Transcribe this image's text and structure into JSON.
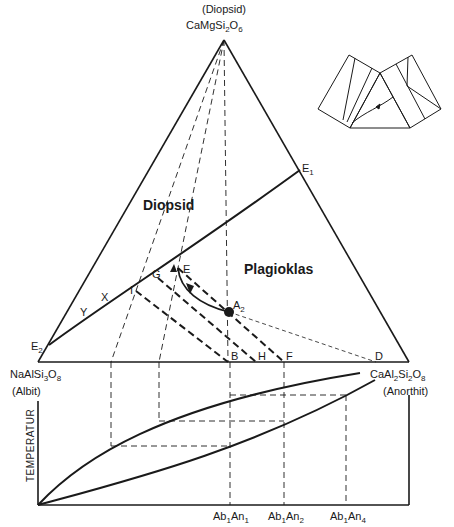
{
  "apex": {
    "name": "(Diopsid)",
    "formula_main": "CaMgSi",
    "sub1": "2",
    "o": "O",
    "sub2": "6"
  },
  "left_vertex": {
    "formula": "NaAlSi",
    "sub1": "3",
    "o": "O",
    "sub2": "8",
    "name": "(Albit)"
  },
  "right_vertex": {
    "formula": "CaAl",
    "sub1": "2",
    "si": "Si",
    "sub2": "2",
    "o": "O",
    "sub3": "8",
    "name": "(Anorthit)"
  },
  "regions": {
    "diopsid": "Diopsid",
    "plagioklas": "Plagioklas"
  },
  "points": {
    "E1": "E",
    "E1_sub": "1",
    "E2": "E",
    "E2_sub": "2",
    "E": "E",
    "G": "G",
    "I": "I",
    "X": "X",
    "Y": "Y",
    "A2": "A",
    "A2_sub": "2",
    "B": "B",
    "H": "H",
    "F": "F",
    "D": "D"
  },
  "lower_chart": {
    "y_axis_label": "TEMPERATUR",
    "x_ticks": [
      {
        "ab": "Ab",
        "ab_sub": "1",
        "an": "An",
        "an_sub": "1"
      },
      {
        "ab": "Ab",
        "ab_sub": "1",
        "an": "An",
        "an_sub": "2"
      },
      {
        "ab": "Ab",
        "ab_sub": "1",
        "an": "An",
        "an_sub": "4"
      }
    ]
  },
  "colors": {
    "ink": "#1a1a1a",
    "background": "#ffffff"
  }
}
